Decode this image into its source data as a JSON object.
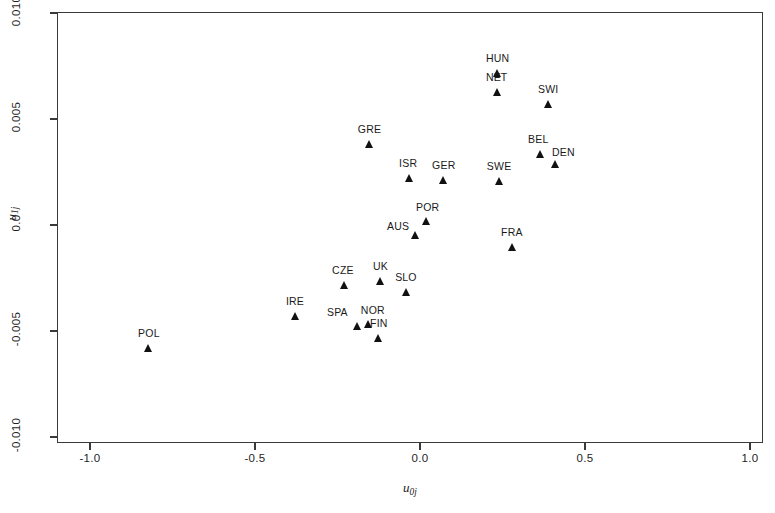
{
  "figure": {
    "background_color": "#ffffff",
    "frame_color": "#3a3a3a",
    "marker_color": "#111111"
  },
  "axes": {
    "x_title_main": "u",
    "x_title_sub": "0j",
    "y_title_main": "u",
    "y_title_sub": "1j",
    "x_ticks": [
      "-1.0",
      "-0.5",
      "0.0",
      "0.5",
      "1.0"
    ],
    "y_ticks": [
      "0.010",
      "0.005",
      "0.0",
      "-0.005",
      "-0.010"
    ]
  },
  "chart_data": {
    "type": "scatter",
    "title": "",
    "xlabel": "u0j",
    "ylabel": "u1j",
    "xlim": [
      -1.15,
      1.15
    ],
    "ylim": [
      -0.0113,
      0.0106
    ],
    "xticks": [
      -1.0,
      -0.5,
      0.0,
      0.5,
      1.0
    ],
    "yticks": [
      0.01,
      0.005,
      0.0,
      -0.005,
      -0.01
    ],
    "grid": false,
    "legend": null,
    "marker": "filled-triangle-up",
    "points": [
      {
        "label": "HUN",
        "x": 0.236,
        "y": 0.00717,
        "label_dx": -12,
        "label_dy": -20
      },
      {
        "label": "NET",
        "x": 0.236,
        "y": 0.00628,
        "label_dx": -12,
        "label_dy": -20
      },
      {
        "label": "SWI",
        "x": 0.391,
        "y": 0.0057,
        "label_dx": -11,
        "label_dy": -20
      },
      {
        "label": "GRE",
        "x": -0.152,
        "y": 0.00383,
        "label_dx": -12,
        "label_dy": -20
      },
      {
        "label": "BEL",
        "x": 0.364,
        "y": 0.00335,
        "label_dx": -12,
        "label_dy": -20
      },
      {
        "label": "DEN",
        "x": 0.412,
        "y": 0.00288,
        "label_dx": -4,
        "label_dy": -17
      },
      {
        "label": "ISR",
        "x": -0.033,
        "y": 0.00222,
        "label_dx": -10,
        "label_dy": -20
      },
      {
        "label": "GER",
        "x": 0.073,
        "y": 0.00213,
        "label_dx": -12,
        "label_dy": -20
      },
      {
        "label": "SWE",
        "x": 0.242,
        "y": 0.00208,
        "label_dx": -13,
        "label_dy": -20
      },
      {
        "label": "POR",
        "x": 0.021,
        "y": 0.00019,
        "label_dx": -11,
        "label_dy": -19
      },
      {
        "label": "AUS",
        "x": -0.012,
        "y": -0.00047,
        "label_dx": -29,
        "label_dy": -14
      },
      {
        "label": "FRA",
        "x": 0.282,
        "y": -0.00104,
        "label_dx": -12,
        "label_dy": -20
      },
      {
        "label": "UK",
        "x": -0.118,
        "y": -0.00264,
        "label_dx": -8,
        "label_dy": -20
      },
      {
        "label": "CZE",
        "x": -0.23,
        "y": -0.00283,
        "label_dx": -12,
        "label_dy": -20
      },
      {
        "label": "SLO",
        "x": -0.042,
        "y": -0.00316,
        "label_dx": -11,
        "label_dy": -20
      },
      {
        "label": "IRE",
        "x": -0.376,
        "y": -0.00429,
        "label_dx": -10,
        "label_dy": -20
      },
      {
        "label": "NOR",
        "x": -0.155,
        "y": -0.00467,
        "label_dx": -8,
        "label_dy": -19
      },
      {
        "label": "SPA",
        "x": -0.188,
        "y": -0.00477,
        "label_dx": -31,
        "label_dy": -19
      },
      {
        "label": "FIN",
        "x": -0.124,
        "y": -0.00533,
        "label_dx": -9,
        "label_dy": -20
      },
      {
        "label": "POL",
        "x": -0.821,
        "y": -0.0058,
        "label_dx": -11,
        "label_dy": -20
      }
    ]
  }
}
